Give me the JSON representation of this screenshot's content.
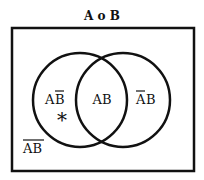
{
  "diagram": {
    "title": "A o B",
    "colors": {
      "stroke": "#111111",
      "background": "#ffffff"
    },
    "universe": {
      "x": 12,
      "y": 28,
      "width": 182,
      "height": 143
    },
    "circles": [
      {
        "name": "A",
        "cx": 80,
        "cy": 100,
        "r": 47
      },
      {
        "name": "B",
        "cx": 123,
        "cy": 100,
        "r": 47
      }
    ],
    "regions": {
      "a_not_b": {
        "base": "AB",
        "overline": "B",
        "text_a": "A",
        "text_b": "B"
      },
      "a_and_b": {
        "text": "AB"
      },
      "not_a_b": {
        "overline": "A",
        "text_a": "A",
        "text_b": "B"
      },
      "not_a_not_b": {
        "text": "AB",
        "overline": "AB"
      }
    },
    "marker": {
      "symbol": "*",
      "region": "a_not_b"
    }
  }
}
